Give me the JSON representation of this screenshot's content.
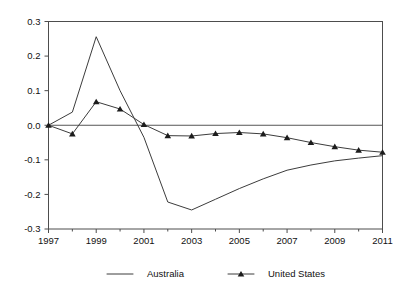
{
  "chart_data": {
    "type": "line",
    "title": "",
    "subtitle": "",
    "xlabel": "",
    "ylabel": "",
    "xlim": [
      1997,
      2011
    ],
    "ylim": [
      -0.3,
      0.3
    ],
    "grid": false,
    "legend_position": "bottom",
    "zero_reference_line": true,
    "x": [
      1997,
      1998,
      1999,
      2000,
      2001,
      2002,
      2003,
      2004,
      2005,
      2006,
      2007,
      2008,
      2009,
      2010,
      2011
    ],
    "y_ticks": [
      0.3,
      0.2,
      0.1,
      0.0,
      -0.1,
      -0.2,
      -0.3
    ],
    "y_tick_labels": [
      "0.3",
      "0.2",
      "0.1",
      "0.0",
      "-0.1",
      "-0.2",
      "-0.3"
    ],
    "x_ticks": [
      1997,
      1999,
      2001,
      2003,
      2005,
      2007,
      2009,
      2011
    ],
    "x_tick_labels": [
      "1997",
      "1999",
      "2001",
      "2003",
      "2005",
      "2007",
      "2009",
      "2011"
    ],
    "x_minor_ticks": [
      1998,
      2000,
      2002,
      2004,
      2006,
      2008,
      2010
    ],
    "series": [
      {
        "name": "Australia",
        "marker": "none",
        "color": "#3c3c3c",
        "values": [
          0.0,
          0.038,
          0.256,
          0.1,
          -0.035,
          -0.222,
          -0.245,
          -0.214,
          -0.183,
          -0.155,
          -0.13,
          -0.115,
          -0.103,
          -0.095,
          -0.088
        ]
      },
      {
        "name": "United States",
        "marker": "triangle",
        "color": "#1c1c1c",
        "values": [
          0.0,
          -0.025,
          0.068,
          0.047,
          0.002,
          -0.03,
          -0.031,
          -0.024,
          -0.021,
          -0.025,
          -0.036,
          -0.05,
          -0.062,
          -0.072,
          -0.078
        ]
      }
    ],
    "legend": [
      {
        "label": "Australia",
        "marker": "none"
      },
      {
        "label": "United States",
        "marker": "triangle"
      }
    ]
  },
  "colors": {
    "background": "#ffffff",
    "axis": "#4d4d4d",
    "text": "#111111",
    "series_australia": "#3c3c3c",
    "series_united_states": "#1c1c1c"
  }
}
